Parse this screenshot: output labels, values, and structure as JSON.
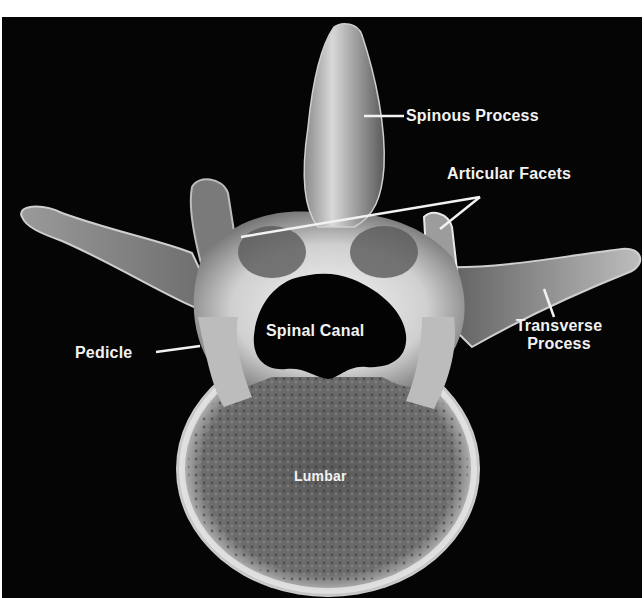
{
  "image": {
    "subject": "Lumbar vertebra X-ray, superior view",
    "background_color": "#050505",
    "label_color": "#f2f2f2",
    "bone_color": "#d8d8d8"
  },
  "labels": {
    "spinous_process": "Spinous Process",
    "articular_facets": "Articular Facets",
    "transverse_process_line1": "Transverse",
    "transverse_process_line2": "Process",
    "pedicle": "Pedicle",
    "spinal_canal": "Spinal Canal",
    "lumbar": "Lumbar"
  }
}
